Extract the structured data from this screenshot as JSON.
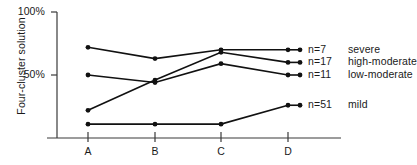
{
  "chart_data": {
    "type": "line",
    "title": "",
    "subtitle": "",
    "xlabel": "",
    "ylabel": "Four-cluster solution",
    "categories": [
      "A",
      "B",
      "C",
      "D"
    ],
    "x_tick_labels": [
      "A",
      "B",
      "C",
      "D"
    ],
    "y_tick_labels": [
      "100%",
      "50%"
    ],
    "y_tick_values": [
      100,
      50
    ],
    "ylim": [
      0,
      100
    ],
    "grid": false,
    "legend_position": "right",
    "marker": "filled-circle",
    "line_color": "#111111",
    "series": [
      {
        "name": "severe",
        "n_label": "n=7",
        "n": 7,
        "values": [
          72,
          63,
          70,
          70
        ]
      },
      {
        "name": "high-moderate",
        "n_label": "n=17",
        "n": 17,
        "values": [
          22,
          46,
          68,
          60
        ]
      },
      {
        "name": "low-moderate",
        "n_label": "n=11",
        "n": 11,
        "values": [
          50,
          44,
          59,
          50
        ]
      },
      {
        "name": "mild",
        "n_label": "n=51",
        "n": 51,
        "values": [
          11,
          11,
          11,
          26
        ]
      }
    ]
  }
}
